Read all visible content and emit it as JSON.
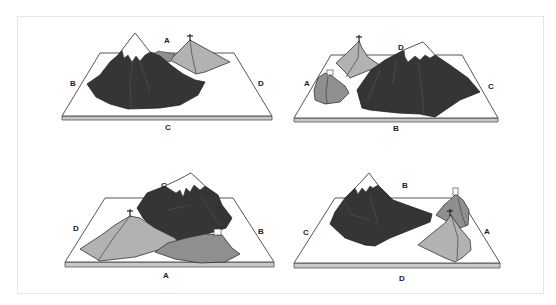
{
  "figure": {
    "colors": {
      "dark_mountain": "#353535",
      "light_mountain": "#b2b2b2",
      "medium_mountain": "#8f8f8f",
      "snow": "#ffffff",
      "board_top": "#ffffff",
      "board_edge": "#c8c8c8",
      "outline": "#333333"
    },
    "panels": [
      {
        "id": "view-c",
        "labels": {
          "top": "A",
          "left": "B",
          "bottom": "C",
          "right": "D"
        },
        "features": [
          "snow-capped peak",
          "peak with cross",
          "board"
        ]
      },
      {
        "id": "view-b",
        "labels": {
          "top": "D",
          "left": "A",
          "bottom": "B",
          "right": "C"
        },
        "features": [
          "snow-capped peak",
          "peak with cross",
          "peak with house",
          "board"
        ]
      },
      {
        "id": "view-a",
        "labels": {
          "top": "C",
          "left": "D",
          "bottom": "A",
          "right": "B"
        },
        "features": [
          "snow-capped peak",
          "peak with cross",
          "peak with house",
          "board"
        ]
      },
      {
        "id": "view-d",
        "labels": {
          "top": "B",
          "left": "C",
          "bottom": "D",
          "right": "A"
        },
        "features": [
          "snow-capped peak",
          "peak with cross",
          "peak with house",
          "board"
        ]
      }
    ]
  }
}
